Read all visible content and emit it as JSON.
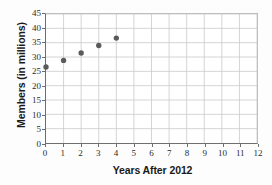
{
  "chart_data": {
    "type": "scatter",
    "title": "",
    "subtitle": "",
    "xlabel": "Years After 2012",
    "ylabel": "Members (in millions)",
    "x": [
      0,
      1,
      2,
      3,
      4
    ],
    "values": [
      26.5,
      28.8,
      31.4,
      34.0,
      36.6
    ],
    "series": [
      {
        "name": "Members",
        "points": [
          {
            "x": 0,
            "y": 26.5
          },
          {
            "x": 1,
            "y": 28.8
          },
          {
            "x": 2,
            "y": 31.4
          },
          {
            "x": 3,
            "y": 34.0
          },
          {
            "x": 4,
            "y": 36.6
          }
        ]
      }
    ],
    "xlim": [
      0,
      12
    ],
    "ylim": [
      0,
      45
    ],
    "xticks": [
      0,
      1,
      2,
      3,
      4,
      5,
      6,
      7,
      8,
      9,
      10,
      11,
      12
    ],
    "yticks": [
      0,
      5,
      10,
      15,
      20,
      25,
      30,
      35,
      40,
      45
    ],
    "xtick_labels": [
      "0",
      "1",
      "2",
      "3",
      "4",
      "5",
      "6",
      "7",
      "8",
      "9",
      "10",
      "11",
      "12"
    ],
    "ytick_labels": [
      "0",
      "5",
      "10",
      "15",
      "20",
      "25",
      "30",
      "35",
      "40",
      "45"
    ],
    "grid": true,
    "legend": false,
    "legend_position": "none",
    "marker_color": "#5a5a5a",
    "grid_color": "#c8c8c8",
    "axis_color": "#6e6e6e",
    "background_color": "#ffffff"
  }
}
